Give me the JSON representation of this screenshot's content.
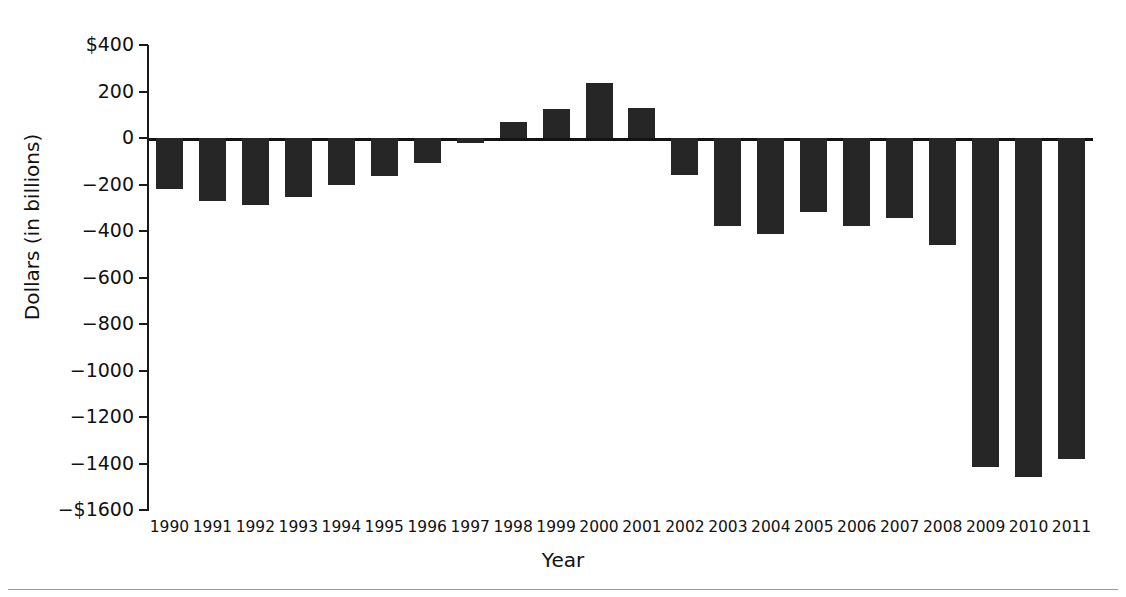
{
  "chart_data": {
    "type": "bar",
    "title": "",
    "xlabel": "Year",
    "ylabel": "Dollars (in billions)",
    "categories": [
      "1990",
      "1991",
      "1992",
      "1993",
      "1994",
      "1995",
      "1996",
      "1997",
      "1998",
      "1999",
      "2000",
      "2001",
      "2002",
      "2003",
      "2004",
      "2005",
      "2006",
      "2007",
      "2008",
      "2009",
      "2010",
      "2011"
    ],
    "values": [
      -221,
      -269,
      -290,
      -255,
      -203,
      -164,
      -107,
      -22,
      69,
      126,
      236,
      128,
      -158,
      -378,
      -413,
      -318,
      -378,
      -345,
      -459,
      -1413,
      -1456,
      -1380
    ],
    "ylim": [
      -1600,
      400
    ],
    "ytick_values": [
      400,
      200,
      0,
      -200,
      -400,
      -600,
      -800,
      -1000,
      -1200,
      -1400,
      -1600
    ],
    "ytick_labels": [
      "$400",
      "200",
      "0",
      "−200",
      "−400",
      "−600",
      "−800",
      "−1000",
      "−1200",
      "−1400",
      "−$1600"
    ],
    "grid": false,
    "legend": null,
    "bar_color": "#262626",
    "axis_color": "#1a1a1a",
    "background_color": "#ffffff"
  }
}
